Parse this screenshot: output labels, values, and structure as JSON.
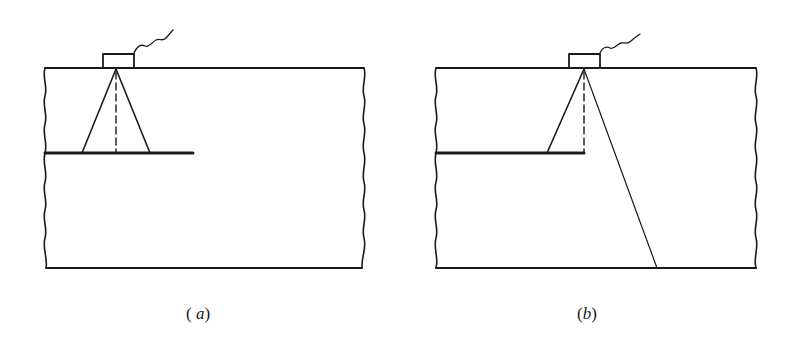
{
  "figure": {
    "colors": {
      "ink": "#1a1a1a",
      "background": "#ffffff"
    },
    "panels": [
      {
        "id": "a",
        "caption_open": "( ",
        "caption_letter": "a",
        "caption_close": ")",
        "block": {
          "left": 45,
          "right": 364,
          "top": 68,
          "bottom": 268
        },
        "transducer": {
          "x": 103,
          "y": 54,
          "w": 31,
          "h": 14
        },
        "apex": [
          116,
          69
        ],
        "beam_left_end": [
          82,
          153
        ],
        "beam_right_end": [
          150,
          153
        ],
        "dashed_end": [
          116,
          153
        ],
        "crack": {
          "x1": 45,
          "x2": 193,
          "y": 153
        }
      },
      {
        "id": "b",
        "caption_open": "(",
        "caption_letter": "b",
        "caption_close": ")",
        "block": {
          "left": 436,
          "right": 756,
          "top": 68,
          "bottom": 268
        },
        "transducer": {
          "x": 569,
          "y": 54,
          "w": 31,
          "h": 14
        },
        "apex": [
          584,
          69
        ],
        "beam_left_end": [
          547,
          153
        ],
        "beam_long_end": [
          657,
          268
        ],
        "dashed_end": [
          584,
          153
        ],
        "crack": {
          "x1": 436,
          "x2": 584,
          "y": 153
        }
      }
    ]
  }
}
